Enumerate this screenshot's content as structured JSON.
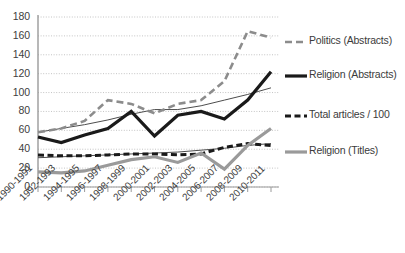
{
  "chart_data": {
    "type": "line",
    "title": "",
    "xlabel": "",
    "ylabel": "",
    "ylim": [
      0,
      180
    ],
    "yticks": [
      0,
      20,
      40,
      60,
      80,
      100,
      120,
      140,
      160,
      180
    ],
    "grid": true,
    "legend_position": "right",
    "categories": [
      "1990-1991",
      "1992-1993",
      "1994-1995",
      "1996-1997",
      "1998-1999",
      "2000-2001",
      "2002-2003",
      "2004-2005",
      "2006-2007",
      "2008-2009",
      "2010-2011"
    ],
    "series": [
      {
        "name": "Politics (Abstracts)",
        "style": "dashed",
        "color": "#8c8c8c",
        "width": 2.6,
        "values": [
          58,
          62,
          70,
          92,
          88,
          78,
          88,
          92,
          112,
          165,
          158
        ]
      },
      {
        "name": "Religion (Abstracts)",
        "style": "solid",
        "color": "#1a1a1a",
        "width": 3.2,
        "values": [
          53,
          47,
          55,
          62,
          80,
          54,
          76,
          80,
          72,
          92,
          122
        ]
      },
      {
        "name": "Total articles / 100",
        "style": "dashed",
        "color": "#1a1a1a",
        "width": 3.0,
        "values": [
          34,
          33,
          33,
          34,
          35,
          35,
          34,
          35,
          42,
          46,
          44
        ]
      },
      {
        "name": "Religion (Titles)",
        "style": "solid",
        "color": "#9a9a9a",
        "width": 3.2,
        "values": [
          16,
          15,
          17,
          23,
          29,
          32,
          26,
          36,
          19,
          44,
          62
        ]
      },
      {
        "name": "trend-thin",
        "style": "solid-thin",
        "color": "#4d4d4d",
        "width": 1.0,
        "values": [
          58,
          62,
          66,
          71,
          77,
          82,
          82,
          86,
          92,
          98,
          105
        ]
      },
      {
        "name": "trend-thin-lower",
        "style": "solid-thin",
        "color": "#4d4d4d",
        "width": 1.0,
        "values": [
          31,
          32,
          33,
          34,
          35,
          36,
          37,
          39,
          41,
          44,
          46
        ]
      }
    ]
  },
  "legend": {
    "items": [
      {
        "label": "Politics (Abstracts)",
        "swatch": "dashed-gray"
      },
      {
        "label": "Religion (Abstracts)",
        "swatch": "solid-black"
      },
      {
        "label": "Total articles / 100",
        "swatch": "dashed-black"
      },
      {
        "label": "Religion (Titles)",
        "swatch": "solid-gray"
      }
    ]
  },
  "axis": {
    "y_labels": [
      "180",
      "160",
      "140",
      "120",
      "100",
      "80",
      "60",
      "40",
      "20",
      "0"
    ]
  }
}
